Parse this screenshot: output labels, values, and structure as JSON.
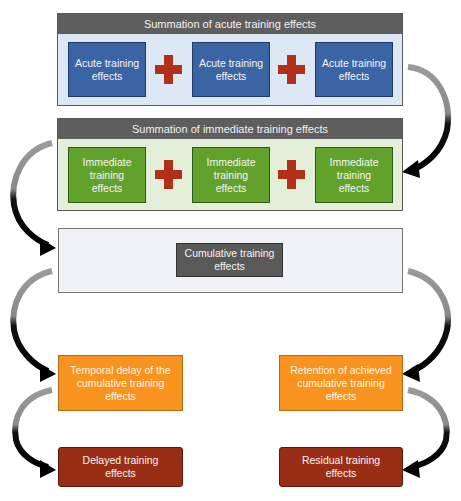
{
  "diagram": {
    "acute_section": {
      "header": "Summation of acute training effects",
      "boxes": [
        "Acute training effects",
        "Acute training effects",
        "Acute training effects"
      ],
      "operator": "plus"
    },
    "immediate_section": {
      "header": "Summation of immediate training effects",
      "boxes": [
        "Immediate training effects",
        "Immediate training effects",
        "Immediate training effects"
      ],
      "operator": "plus"
    },
    "cumulative_section": {
      "box": "Cumulative training effects"
    },
    "left_branch": {
      "process": "Temporal delay of the cumulative training effects",
      "result": "Delayed training effects"
    },
    "right_branch": {
      "process": "Retention of achieved cumulative training effects",
      "result": "Residual training effects"
    },
    "colors": {
      "acute": "#3a64a4",
      "immediate": "#62a12c",
      "cumulative": "#595959",
      "process": "#f7931e",
      "result": "#9a2e14",
      "plus": "#b0301a",
      "header": "#5e5e5e"
    }
  }
}
